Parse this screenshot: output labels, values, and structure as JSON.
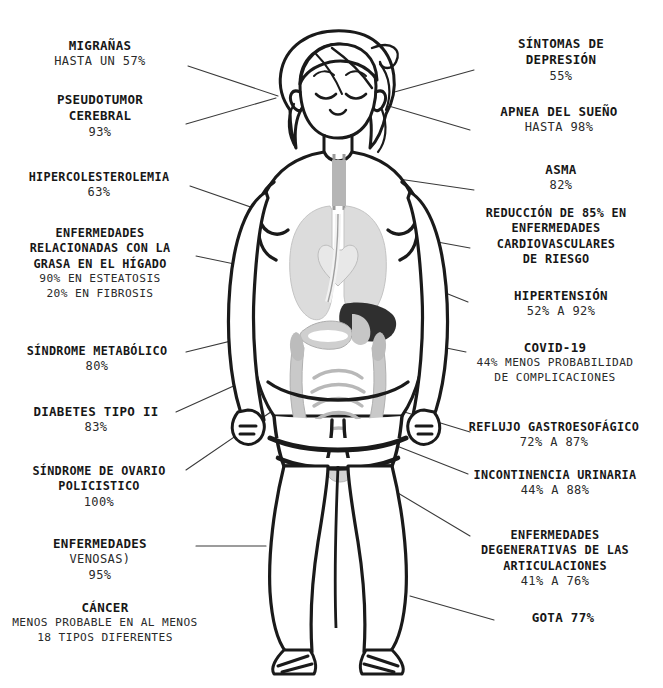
{
  "title": "",
  "colors": {
    "ink": "#171717",
    "line": "#3a3a3a",
    "organ_lung": "#d9d9d9",
    "organ_liver": "#3c3c3c",
    "organ_intestine": "#bdbdbd",
    "skin": "#ffffff"
  },
  "figure": {
    "name": "cartoon-woman-with-internal-organs"
  },
  "left_callouts": [
    {
      "title": "MIGRAÑAS",
      "value": "HASTA UN 57%"
    },
    {
      "title": "PSEUDOTUMOR\nCEREBRAL",
      "value": "93%"
    },
    {
      "title": "HIPERCOLESTEROLEMIA",
      "value": "63%"
    },
    {
      "title": "ENFERMEDADES\nRELACIONADAS CON LA\nGRASA EN EL HÍGADO",
      "value": "90% EN ESTEATOSIS\n20% EN FIBROSIS"
    },
    {
      "title": "SÍNDROME METABÓLICO",
      "value": "80%"
    },
    {
      "title": "DIABETES TIPO II",
      "value": "83%"
    },
    {
      "title": "SÍNDROME DE OVARIO\nPOLICISTICO",
      "value": "100%"
    },
    {
      "title": "ENFERMEDADES",
      "value": "VENOSAS)\n95%"
    },
    {
      "title": "CÁNCER",
      "value": "MENOS PROBABLE EN AL MENOS\n18 TIPOS DIFERENTES"
    }
  ],
  "right_callouts": [
    {
      "title": "SÍNTOMAS DE\nDEPRESIÓN",
      "value": "55%"
    },
    {
      "title": "APNEA DEL SUEÑO",
      "value": "HASTA 98%"
    },
    {
      "title": "ASMA",
      "value": "82%"
    },
    {
      "title": "REDUCCIÓN DE 85% EN\nENFERMEDADES\nCARDIOVASCULARES\nDE RIESGO",
      "value": ""
    },
    {
      "title": "HIPERTENSIÓN",
      "value": "52% A 92%"
    },
    {
      "title": "COVID-19",
      "value": "44% MENOS PROBABILIDAD\nDE COMPLICACIONES"
    },
    {
      "title": "REFLUJO GASTROESOFÁGICO",
      "value": "72% A 87%"
    },
    {
      "title": "INCONTINENCIA URINARIA",
      "value": "44% A 88%"
    },
    {
      "title": "ENFERMEDADES\nDEGENERATIVAS DE LAS\nARTICULACIONES",
      "value": "41% A 76%"
    },
    {
      "title": "GOTA 77%",
      "value": ""
    }
  ]
}
